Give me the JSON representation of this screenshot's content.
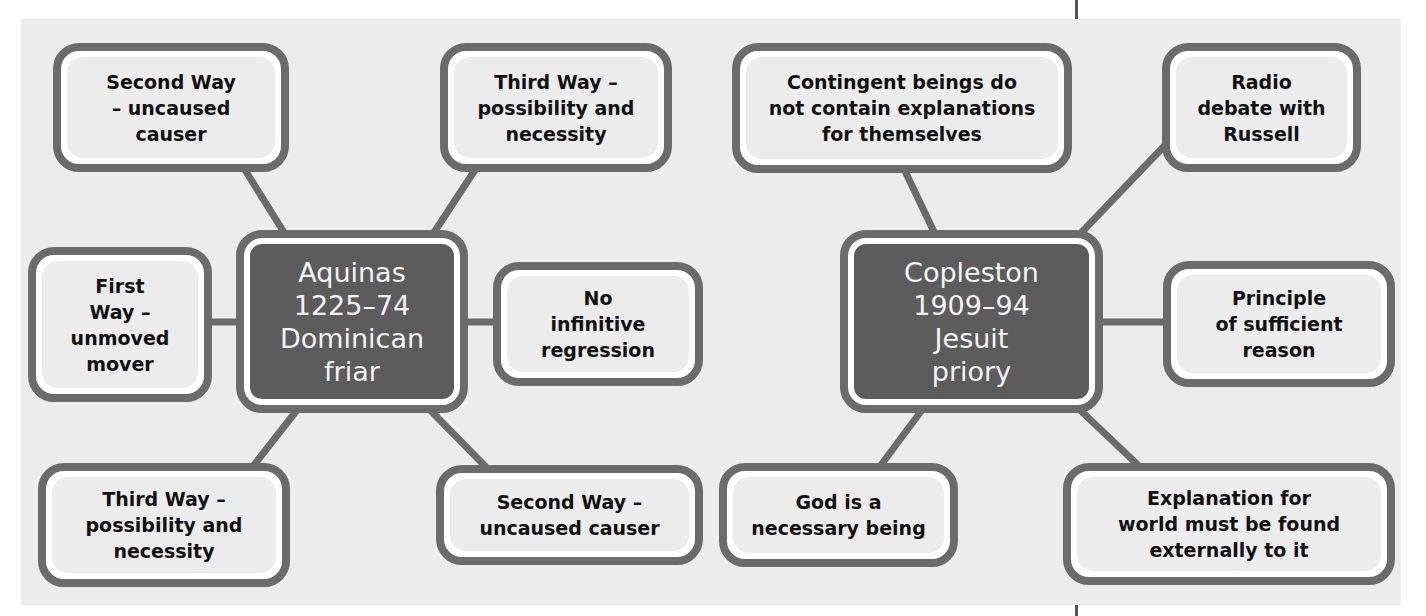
{
  "colors": {
    "panel_bg": "#ececec",
    "border": "#6b6b6b",
    "center_fill": "#5c5c5c",
    "center_text": "#f4f4f4",
    "node_fill": "#ececec"
  },
  "top_fragment": "p",
  "aquinas": {
    "center": "Aquinas\n1225–74\nDominican\nfriar",
    "nodes": {
      "top_left": "Second Way\n– uncaused\ncauser",
      "top_right": "Third Way –\npossibility and\nnecessity",
      "left": "First\nWay –\nunmoved\nmover",
      "right": "No\ninfinitive\nregression",
      "bottom_left": "Third Way –\npossibility and\nnecessity",
      "bottom_right": "Second Way –\nuncaused causer"
    }
  },
  "copleston": {
    "center": "Copleston\n1909–94\nJesuit\npriory",
    "nodes": {
      "top_left": "Contingent beings do\nnot contain explanations\nfor themselves",
      "top_right": "Radio\ndebate with\nRussell",
      "right": "Principle\nof sufficient\nreason",
      "bottom_left": "God is a\nnecessary being",
      "bottom_right": "Explanation for\nworld must be found\nexternally to it"
    }
  }
}
